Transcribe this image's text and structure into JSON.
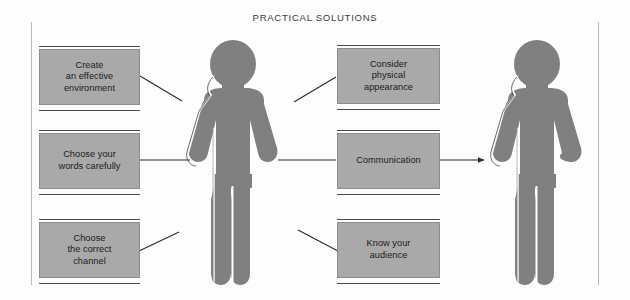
{
  "title": "PRACTICAL SOLUTIONS",
  "colors": {
    "box_fill": "#a9a9a9",
    "figure_fill": "#808080",
    "text": "#1b1b1b",
    "rule": "#4a4a4a",
    "frame": "#b9b9b9",
    "background": "#ffffff"
  },
  "boxes": [
    {
      "id": "create-effective-environment",
      "label": "Create\nan effective\nenvironment"
    },
    {
      "id": "choose-your-words-carefully",
      "label": "Choose your\nwords carefully"
    },
    {
      "id": "choose-the-correct-channel",
      "label": "Choose\nthe correct\nchannel"
    },
    {
      "id": "consider-physical-appearance",
      "label": "Consider\nphysical\nappearance"
    },
    {
      "id": "communication",
      "label": "Communication"
    },
    {
      "id": "know-your-audience",
      "label": "Know your\naudience"
    }
  ],
  "figures": [
    {
      "id": "sender-figure",
      "label": "person-pictogram"
    },
    {
      "id": "receiver-figure",
      "label": "person-pictogram"
    }
  ],
  "connectors": [
    {
      "id": "connector-environment",
      "kind": "line"
    },
    {
      "id": "connector-words",
      "kind": "line"
    },
    {
      "id": "connector-channel",
      "kind": "line"
    },
    {
      "id": "connector-appearance",
      "kind": "line"
    },
    {
      "id": "connector-communication-in",
      "kind": "line"
    },
    {
      "id": "connector-communication-out",
      "kind": "arrow"
    },
    {
      "id": "connector-audience",
      "kind": "line"
    }
  ]
}
